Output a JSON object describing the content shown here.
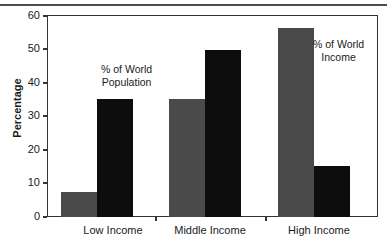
{
  "chart_data": {
    "type": "bar",
    "title": "",
    "subtitle": "",
    "xlabel": "",
    "ylabel": "Percentage",
    "categories": [
      "Low Income",
      "Middle Income",
      "High Income"
    ],
    "ylim": [
      0,
      60
    ],
    "yticks": [
      0,
      10,
      20,
      30,
      40,
      50,
      60
    ],
    "ytick_labels": [
      "0",
      "10",
      "20",
      "30",
      "40",
      "50",
      "60"
    ],
    "grid": false,
    "legend_position": "inline-annotations",
    "series": [
      {
        "name": "% of World Income",
        "color": "#4a4a4a",
        "values": [
          7.5,
          35.5,
          57.0
        ]
      },
      {
        "name": "% of World Population",
        "color": "#0d0d0d",
        "values": [
          35.5,
          50.5,
          15.5
        ]
      }
    ],
    "annotations": [
      {
        "text_lines": [
          "% of World",
          "Population"
        ],
        "target_series": "% of World Population"
      },
      {
        "text_lines": [
          "% of World",
          "Income"
        ],
        "target_series": "% of World Income"
      }
    ]
  },
  "axis": {
    "y_title": "Percentage",
    "ytick_labels": [
      "60",
      "50",
      "40",
      "30",
      "20",
      "10",
      "0"
    ],
    "xtick_labels": [
      "Low Income",
      "Middle Income",
      "High Income"
    ]
  },
  "annotations": {
    "population_line1": "% of World",
    "population_line2": "Population",
    "income_line1": "% of World",
    "income_line2": "Income"
  },
  "colors": {
    "gray_bar": "#4a4a4a",
    "black_bar": "#0d0d0d",
    "axis": "#333333",
    "text": "#1a1a1a",
    "background": "#ffffff"
  }
}
